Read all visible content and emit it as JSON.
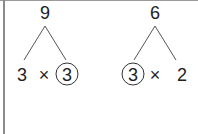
{
  "trees": [
    {
      "root": "9",
      "left": "3",
      "operator": "×",
      "right": "3",
      "circled": "right"
    },
    {
      "root": "6",
      "left": "3",
      "operator": "×",
      "right": "2",
      "circled": "left"
    }
  ]
}
